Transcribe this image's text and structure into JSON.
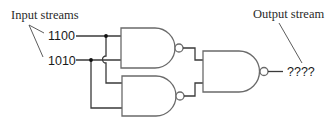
{
  "diagram": {
    "type": "logic-circuit",
    "labels": {
      "input_streams": "Input streams",
      "output_stream": "Output stream"
    },
    "inputs": [
      {
        "id": "A",
        "value": "1100"
      },
      {
        "id": "B",
        "value": "1010"
      }
    ],
    "gates": [
      {
        "id": "gate-1",
        "type": "NAND",
        "inputs": [
          "A",
          "B"
        ]
      },
      {
        "id": "gate-2",
        "type": "NAND",
        "inputs": [
          "A",
          "B"
        ]
      },
      {
        "id": "gate-3",
        "type": "NAND",
        "inputs": [
          "gate-1",
          "gate-2"
        ]
      }
    ],
    "output": {
      "value": "????"
    },
    "colors": {
      "wire": "#3a3a3a",
      "gate_outline": "#6a6a6a",
      "text": "#1a1a1a",
      "background": "#ffffff"
    }
  }
}
